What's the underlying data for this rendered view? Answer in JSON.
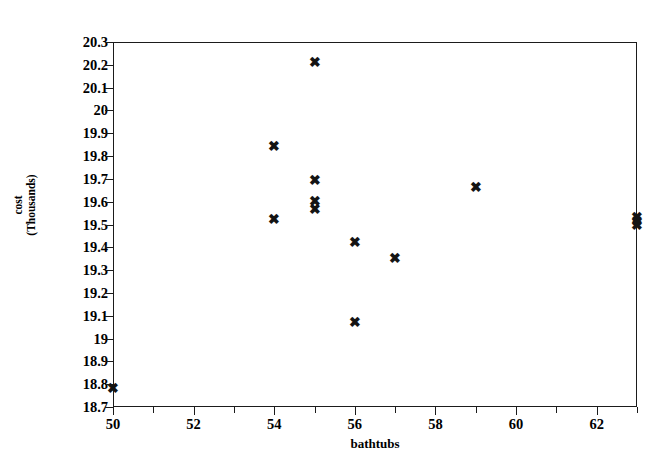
{
  "chart_data": {
    "type": "scatter",
    "title": "",
    "xlabel": "bathtubs",
    "ylabel": "cost (Thousands)",
    "ylabel_lines": [
      "cost",
      "(Thousands)"
    ],
    "xlim": [
      50,
      63
    ],
    "ylim": [
      18.7,
      20.3
    ],
    "grid": false,
    "legend": null,
    "marker": "x",
    "marker_color": "#141414",
    "axis_color": "#1b1b1b",
    "background": "#ffffff",
    "x_ticks": [
      50,
      52,
      54,
      56,
      58,
      60,
      62
    ],
    "x_tick_labels": [
      "50",
      "52",
      "54",
      "56",
      "58",
      "60",
      "62"
    ],
    "x_minor_ticks": [
      51,
      53,
      55,
      57,
      59,
      61,
      63
    ],
    "y_ticks": [
      18.7,
      18.8,
      18.9,
      19.0,
      19.1,
      19.2,
      19.3,
      19.4,
      19.5,
      19.6,
      19.7,
      19.8,
      19.9,
      20.0,
      20.1,
      20.2,
      20.3
    ],
    "y_tick_labels": [
      "18.7",
      "18.8",
      "18.9",
      "19",
      "19.1",
      "19.2",
      "19.3",
      "19.4",
      "19.5",
      "19.6",
      "19.7",
      "19.8",
      "19.9",
      "20",
      "20.1",
      "20.2",
      "20.3"
    ],
    "points": [
      {
        "x": 50,
        "y": 18.78
      },
      {
        "x": 54,
        "y": 19.84
      },
      {
        "x": 54,
        "y": 19.52
      },
      {
        "x": 55,
        "y": 20.21
      },
      {
        "x": 55,
        "y": 19.69
      },
      {
        "x": 55,
        "y": 19.6
      },
      {
        "x": 55,
        "y": 19.565
      },
      {
        "x": 56,
        "y": 19.42
      },
      {
        "x": 56,
        "y": 19.07
      },
      {
        "x": 57,
        "y": 19.35
      },
      {
        "x": 59,
        "y": 19.66
      },
      {
        "x": 63,
        "y": 19.53
      },
      {
        "x": 63,
        "y": 19.51
      },
      {
        "x": 63,
        "y": 19.495
      }
    ]
  }
}
